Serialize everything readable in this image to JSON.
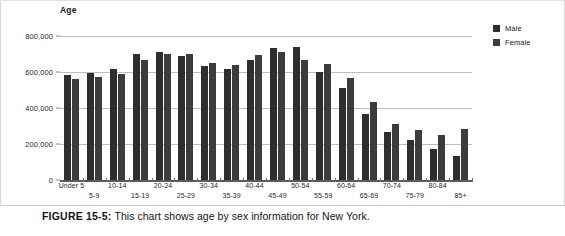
{
  "figure": {
    "caption_label": "FIGURE 15-5:",
    "caption_text": "This chart shows age by sex information for New York."
  },
  "legend": {
    "position": "top-right",
    "entries": [
      {
        "label": "Male",
        "color": "#2e2e2e"
      },
      {
        "label": "Female",
        "color": "#3c3c3c"
      }
    ]
  },
  "axis": {
    "y_ticks": [
      "800,000",
      "600,000",
      "400,000",
      "200,000",
      "0"
    ]
  },
  "chart_data": {
    "type": "bar",
    "title": "Age",
    "xlabel": "",
    "ylabel": "Age",
    "ylim": [
      0,
      800000
    ],
    "ytick_values": [
      800000,
      600000,
      400000,
      200000,
      0
    ],
    "ytick_labels": [
      "800,000",
      "600,000",
      "400,000",
      "200,000",
      "0"
    ],
    "grid": true,
    "legend_position": "top-right",
    "categories": [
      "Under 5",
      "5-9",
      "10-14",
      "15-19",
      "20-24",
      "25-29",
      "30-34",
      "35-39",
      "40-44",
      "45-49",
      "50-54",
      "55-59",
      "60-64",
      "65-69",
      "70-74",
      "75-79",
      "80-84",
      "85+"
    ],
    "series": [
      {
        "name": "Male",
        "color": "#2e2e2e",
        "values": [
          586000,
          594000,
          619000,
          700000,
          712000,
          688000,
          632000,
          615000,
          665000,
          733000,
          737000,
          600000,
          510000,
          365000,
          266000,
          224000,
          172000,
          134000
        ]
      },
      {
        "name": "Female",
        "color": "#3c3c3c",
        "values": [
          560000,
          570000,
          590000,
          665000,
          702000,
          702000,
          652000,
          641000,
          696000,
          712000,
          667000,
          646000,
          565000,
          432000,
          311000,
          276000,
          251000,
          284000
        ]
      }
    ]
  }
}
